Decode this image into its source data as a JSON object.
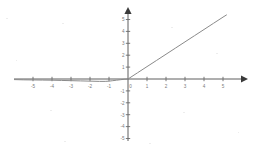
{
  "figure": {
    "background_color": "#ffffff",
    "axis_color": "#5f5f5f",
    "curve_color": "#8a8a8a",
    "label_color": "#7a7a7a"
  },
  "chart_data": {
    "type": "line",
    "title": "",
    "subtitle": "",
    "xlabel": "",
    "ylabel": "",
    "xlim": [
      -6,
      6
    ],
    "ylim": [
      -6,
      6
    ],
    "grid": false,
    "legend": false,
    "legend_position": "none",
    "axis_style": "cartesian-arrows",
    "x_ticks": [
      -5,
      -4,
      -3,
      -2,
      -1,
      0,
      1,
      2,
      3,
      4,
      5
    ],
    "y_ticks": [
      -5,
      -4,
      -3,
      -2,
      -1,
      0,
      1,
      2,
      3,
      4,
      5
    ],
    "x_tick_labels": [
      "-5",
      "-4",
      "-3",
      "-2",
      "-1",
      "0",
      "1",
      "2",
      "3",
      "4",
      "5"
    ],
    "y_tick_labels": [
      "-5",
      "-4",
      "-3",
      "-2",
      "-1",
      "",
      "1",
      "2",
      "3",
      "4",
      "5"
    ],
    "series": [
      {
        "name": "",
        "description": "rectifier-like curve: flat near zero for negative x, linear slope 1 for positive x",
        "x": [
          -6.0,
          -5.5,
          -5.0,
          -4.5,
          -4.0,
          -3.5,
          -3.0,
          -2.5,
          -2.0,
          -1.5,
          -1.2,
          -1.0,
          -0.8,
          -0.6,
          -0.4,
          -0.2,
          0.0,
          0.5,
          1.0,
          1.5,
          2.0,
          2.5,
          3.0,
          3.5,
          4.0,
          4.5,
          5.0,
          5.2
        ],
        "y": [
          -0.05,
          -0.07,
          -0.08,
          -0.09,
          -0.1,
          -0.12,
          -0.14,
          -0.16,
          -0.18,
          -0.2,
          -0.2,
          -0.18,
          -0.14,
          -0.1,
          -0.06,
          -0.02,
          0.0,
          0.52,
          1.04,
          1.56,
          2.08,
          2.6,
          3.12,
          3.64,
          4.16,
          4.68,
          5.2,
          5.4
        ]
      }
    ],
    "annotations": []
  },
  "axes": {
    "x_axis_name": "x-axis",
    "y_axis_name": "y-axis"
  }
}
